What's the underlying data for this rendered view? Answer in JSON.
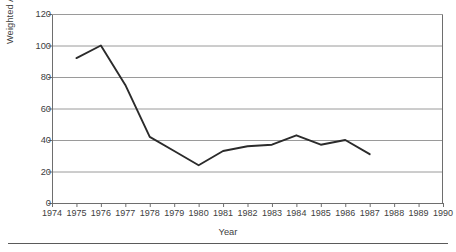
{
  "chart_data": {
    "type": "line",
    "title": "",
    "xlabel": "Year",
    "ylabel": "Weighted Average Maturity in Days",
    "xlim": [
      1974,
      1990
    ],
    "ylim": [
      0,
      120
    ],
    "grid": true,
    "legend": "none",
    "xticks": [
      "1974",
      "1975",
      "1976",
      "1977",
      "1978",
      "1979",
      "1980",
      "1981",
      "1982",
      "1983",
      "1984",
      "1985",
      "1986",
      "1987",
      "1988",
      "1989",
      "1990"
    ],
    "yticks": [
      "0",
      "20",
      "40",
      "60",
      "80",
      "100",
      "120"
    ],
    "x": [
      1975,
      1976,
      1977,
      1978,
      1979,
      1980,
      1981,
      1982,
      1983,
      1984,
      1985,
      1986,
      1987
    ],
    "values": [
      92,
      100,
      75,
      42,
      33,
      24,
      33,
      36,
      37,
      43,
      37,
      40,
      31
    ],
    "series": [
      {
        "name": "Weighted Average Maturity in Days",
        "color": "#2b2b2b",
        "values": [
          92,
          100,
          75,
          42,
          33,
          24,
          33,
          36,
          37,
          43,
          37,
          40,
          31
        ]
      }
    ]
  },
  "style": {
    "line_color": "#2b2b2b",
    "grid_color": "#9a9a9a",
    "frame_color": "#6e6e6e",
    "text_color": "#404040",
    "background": "#ffffff"
  }
}
